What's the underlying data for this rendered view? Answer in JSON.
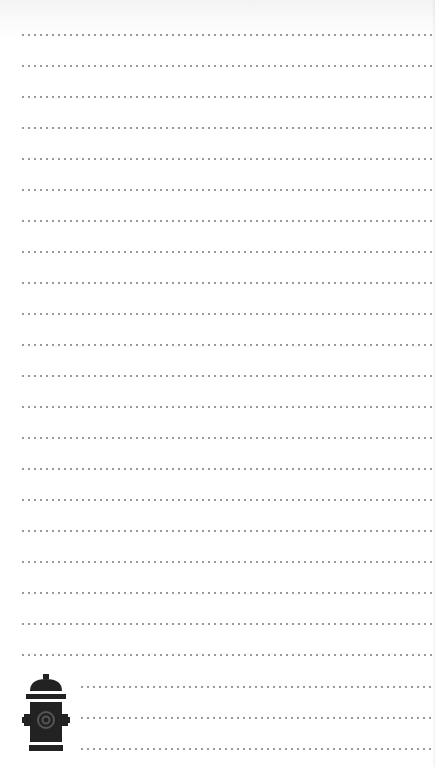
{
  "page": {
    "type": "ruled-notepad",
    "background_color": "#ffffff",
    "rule_color": "#9a9a9a",
    "full_width_rules": 21,
    "short_rules": 3,
    "rule_spacing_px": 31
  },
  "icon": {
    "name": "fire-hydrant-icon",
    "color": "#222222"
  }
}
